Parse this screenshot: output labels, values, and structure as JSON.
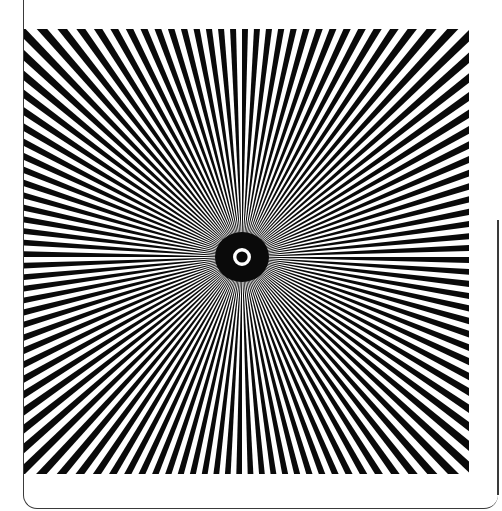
{
  "image": {
    "title": "Siemens star test pattern",
    "spoke_count": 120,
    "colors": {
      "spoke": "#0a0a0a",
      "background": "#ffffff",
      "frame": "#3a3a3a"
    },
    "center_ring": {
      "ring_color": "#ffffff",
      "blob_color": "#0a0a0a"
    }
  }
}
